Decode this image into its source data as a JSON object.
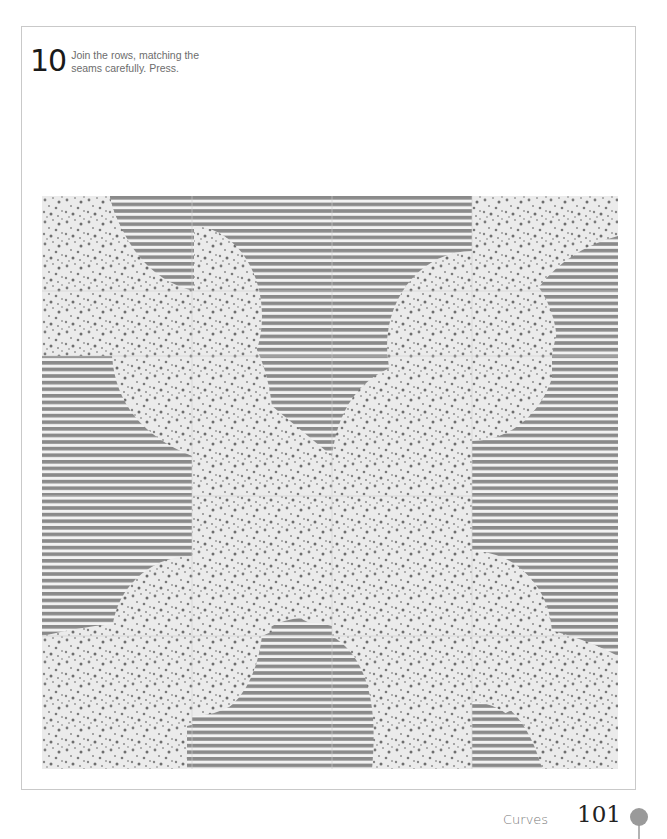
{
  "step": {
    "number": "10",
    "instruction": "Join the rows, matching the seams carefully. Press."
  },
  "figure": {
    "fabrics": {
      "stripe_color": "#8a8a8a",
      "stripe_bg": "#f2f2f2",
      "dot_color": "#7a7a7a",
      "dot_bg": "#ececec"
    }
  },
  "footer": {
    "section": "Curves",
    "page_number": "101",
    "icon": "flower-icon",
    "icon_color": "#9a9a9a"
  }
}
